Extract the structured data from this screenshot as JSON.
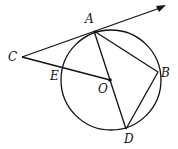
{
  "diagram": {
    "type": "circle-geometry",
    "circle": {
      "center": "O",
      "cx": 111,
      "cy": 80,
      "r": 50
    },
    "points": {
      "A": {
        "x": 94,
        "y": 31,
        "label": "A",
        "lx": 85,
        "ly": 23
      },
      "B": {
        "x": 158,
        "y": 72,
        "label": "B",
        "lx": 161,
        "ly": 77
      },
      "C": {
        "x": 22,
        "y": 57,
        "label": "C",
        "lx": 8,
        "ly": 61
      },
      "D": {
        "x": 126,
        "y": 129,
        "label": "D",
        "lx": 124,
        "ly": 143
      },
      "E": {
        "x": 61,
        "y": 70,
        "label": "E",
        "lx": 50,
        "ly": 80
      },
      "O": {
        "x": 110,
        "y": 80,
        "label": "O",
        "lx": 98,
        "ly": 93
      }
    },
    "segments": [
      [
        "C",
        "A"
      ],
      [
        "C",
        "O"
      ],
      [
        "A",
        "D"
      ],
      [
        "A",
        "B"
      ],
      [
        "B",
        "D"
      ]
    ],
    "ray": {
      "from": "C",
      "through": "A",
      "tip_x": 165,
      "tip_y": 6
    }
  }
}
